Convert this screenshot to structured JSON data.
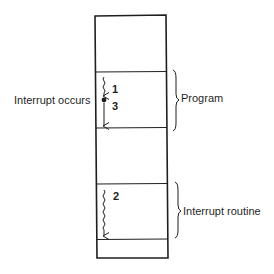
{
  "diagram": {
    "type": "memory-interrupt-flow",
    "colors": {
      "line": "#1f1f1f",
      "background": "#ffffff"
    },
    "memory_block": {
      "segments": [
        {
          "name": "upper-region",
          "role": "empty"
        },
        {
          "name": "program-region",
          "role": "program"
        },
        {
          "name": "middle-region",
          "role": "empty"
        },
        {
          "name": "interrupt-routine-region",
          "role": "interrupt routine"
        },
        {
          "name": "lower-region",
          "role": "empty"
        }
      ]
    },
    "labels": {
      "interrupt_occurs": "Interrupt occurs",
      "program": "Program",
      "interrupt_routine": "Interrupt routine"
    },
    "steps": [
      {
        "number": "1",
        "description": "Program executes until interrupt"
      },
      {
        "number": "2",
        "description": "Interrupt routine executes"
      },
      {
        "number": "3",
        "description": "Program resumes after interrupt"
      }
    ]
  }
}
